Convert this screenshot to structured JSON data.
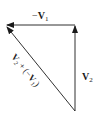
{
  "diagram": {
    "type": "vector-triangle",
    "vectors": [
      {
        "name": "neg_v1",
        "label_prefix": "−",
        "label_main": "V",
        "label_sub": "1",
        "direction": "left",
        "from": [
          75,
          25
        ],
        "to": [
          6,
          25
        ]
      },
      {
        "name": "v2",
        "label_prefix": "",
        "label_main": "V",
        "label_sub": "2",
        "direction": "up",
        "from": [
          75,
          111
        ],
        "to": [
          75,
          25
        ]
      },
      {
        "name": "resultant",
        "label": "V₂ + (−V₁)",
        "direction": "up-left",
        "from": [
          75,
          111
        ],
        "to": [
          6,
          27
        ]
      }
    ],
    "labels": {
      "neg_v1_prefix": "−",
      "neg_v1_main": "V",
      "neg_v1_sub": "1",
      "v2_main": "V",
      "v2_sub": "2",
      "resultant_a_main": "V",
      "resultant_a_sub": "2",
      "resultant_plus": "+",
      "resultant_open": "(−",
      "resultant_b_main": "V",
      "resultant_b_sub": "1",
      "resultant_close": ")"
    },
    "colors": {
      "line": "#1a1a1a",
      "background": "#ffffff"
    }
  }
}
